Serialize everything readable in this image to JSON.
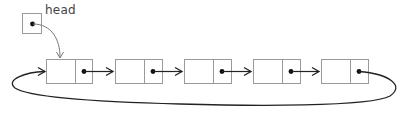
{
  "diagram": {
    "type": "circular-singly-linked-list",
    "head_label": "head",
    "node_count": 5,
    "nodes": [
      {
        "id": "node-1",
        "next": "node-2"
      },
      {
        "id": "node-2",
        "next": "node-3"
      },
      {
        "id": "node-3",
        "next": "node-4"
      },
      {
        "id": "node-4",
        "next": "node-5"
      },
      {
        "id": "node-5",
        "next": "node-1"
      }
    ],
    "head_points_to": "node-1",
    "colors": {
      "box_stroke": "#9a9a9a",
      "arrow": "#222222",
      "pointer_dot": "#111111",
      "head_arrow": "#777777"
    }
  }
}
